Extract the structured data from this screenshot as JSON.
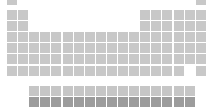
{
  "colors": {
    "main": "#c8c8c8",
    "lanthanide": "#c6c6c6",
    "actinide": "#9c9c9c",
    "background": "#ffffff"
  },
  "layout": {
    "col_x0": 7,
    "col_step": 11.1,
    "row_tops": [
      -5,
      10,
      21,
      32,
      43,
      54,
      66
    ],
    "f_row_tops": [
      86,
      97
    ],
    "f_col_start": 3,
    "f_count": 15
  },
  "main_rows": [
    [
      1,
      18
    ],
    [
      1,
      2,
      13,
      14,
      15,
      16,
      17,
      18
    ],
    [
      1,
      2,
      13,
      14,
      15,
      16,
      17,
      18
    ],
    [
      1,
      2,
      3,
      4,
      5,
      6,
      7,
      8,
      9,
      10,
      11,
      12,
      13,
      14,
      15,
      16,
      17,
      18
    ],
    [
      1,
      2,
      3,
      4,
      5,
      6,
      7,
      8,
      9,
      10,
      11,
      12,
      13,
      14,
      15,
      16,
      17,
      18
    ],
    [
      1,
      2,
      3,
      4,
      5,
      6,
      7,
      8,
      9,
      10,
      11,
      12,
      13,
      14,
      15,
      16,
      17,
      18
    ],
    [
      1,
      2,
      3,
      4,
      5,
      6,
      7,
      8,
      9,
      10,
      11,
      12,
      13,
      14,
      15,
      16,
      18
    ]
  ]
}
